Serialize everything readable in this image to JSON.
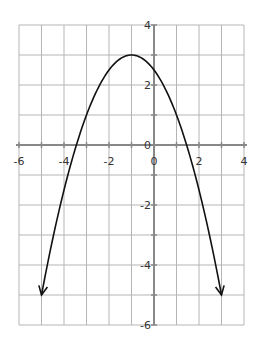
{
  "chart_data": {
    "type": "line",
    "title": "",
    "xlabel": "",
    "ylabel": "",
    "xlim": [
      -6,
      4
    ],
    "ylim": [
      -6,
      4
    ],
    "grid": true,
    "x_ticks": [
      "-6",
      "-4",
      "-2",
      "0",
      "2",
      "4"
    ],
    "y_ticks": [
      "4",
      "2",
      "0",
      "-2",
      "-4",
      "-6"
    ],
    "series": [
      {
        "name": "parabola",
        "equation": "y = -0.5(x + 1)^2 + 3",
        "vertex": [
          -1,
          3
        ],
        "endpoints_with_arrows": [
          [
            -5,
            -5
          ],
          [
            3,
            -5
          ]
        ],
        "x": [
          -5,
          -4,
          -3,
          -2,
          -1,
          0,
          1,
          2,
          3
        ],
        "y": [
          -5,
          -1.5,
          1,
          2.5,
          3,
          2.5,
          1,
          -1.5,
          -5
        ]
      }
    ]
  }
}
